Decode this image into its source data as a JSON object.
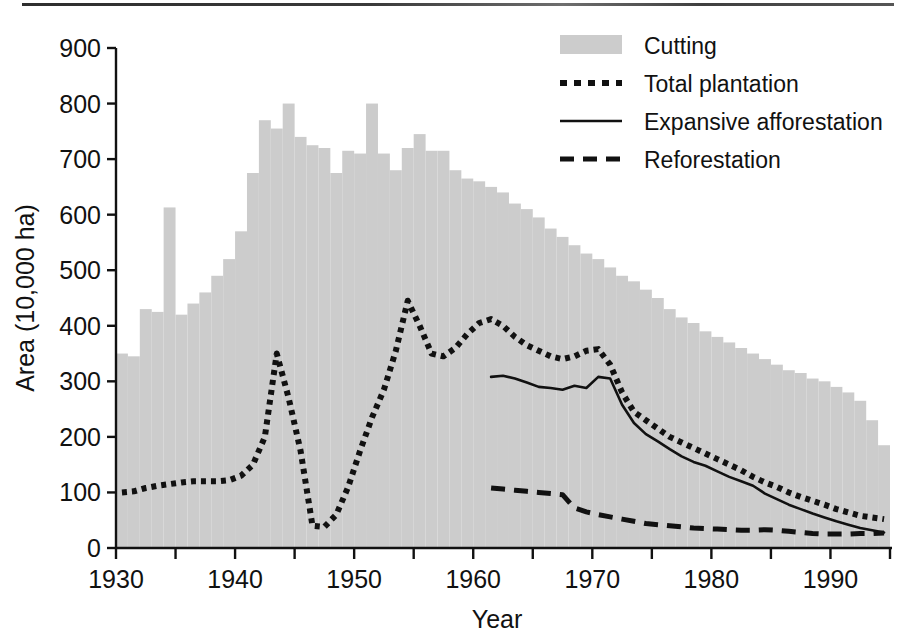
{
  "chart_data": {
    "type": "bar",
    "title": "",
    "xlabel": "Year",
    "ylabel": "Area (10,000 ha)",
    "xlim": [
      1930,
      1995
    ],
    "ylim": [
      0,
      900
    ],
    "grid": false,
    "legend_position": "top-right",
    "xticks": [
      1930,
      1940,
      1950,
      1960,
      1970,
      1980,
      1990
    ],
    "xtick_labels": [
      "1930",
      "1940",
      "1950",
      "1960",
      "1970",
      "1980",
      "1990"
    ],
    "xminor_tick_interval": 5,
    "yticks": [
      0,
      100,
      200,
      300,
      400,
      500,
      600,
      700,
      800,
      900
    ],
    "ytick_labels": [
      "0",
      "100",
      "200",
      "300",
      "400",
      "500",
      "600",
      "700",
      "800",
      "900"
    ],
    "legend": [
      {
        "label": "Cutting",
        "marker": "filled-rect",
        "color": "#cccccc"
      },
      {
        "label": "Total plantation",
        "marker": "dotted-line",
        "color": "#111111"
      },
      {
        "label": "Expansive afforestation",
        "marker": "solid-line",
        "color": "#111111"
      },
      {
        "label": "Reforestation",
        "marker": "dashed-line",
        "color": "#111111"
      }
    ],
    "series": [
      {
        "name": "Cutting",
        "type": "bar",
        "color": "#cccccc",
        "x": [
          1930,
          1931,
          1932,
          1933,
          1934,
          1935,
          1936,
          1937,
          1938,
          1939,
          1940,
          1941,
          1942,
          1943,
          1944,
          1945,
          1946,
          1947,
          1948,
          1949,
          1950,
          1951,
          1952,
          1953,
          1954,
          1955,
          1956,
          1957,
          1958,
          1959,
          1960,
          1961,
          1962,
          1963,
          1964,
          1965,
          1966,
          1967,
          1968,
          1969,
          1970,
          1971,
          1972,
          1973,
          1974,
          1975,
          1976,
          1977,
          1978,
          1979,
          1980,
          1981,
          1982,
          1983,
          1984,
          1985,
          1986,
          1987,
          1988,
          1989,
          1990,
          1991,
          1992,
          1993,
          1994
        ],
        "values": [
          350,
          345,
          430,
          425,
          613,
          420,
          440,
          460,
          490,
          520,
          570,
          675,
          770,
          755,
          800,
          740,
          725,
          720,
          675,
          715,
          710,
          800,
          710,
          680,
          720,
          745,
          715,
          715,
          680,
          665,
          660,
          650,
          640,
          620,
          610,
          595,
          575,
          560,
          545,
          530,
          520,
          505,
          490,
          480,
          465,
          450,
          430,
          415,
          405,
          390,
          380,
          370,
          360,
          350,
          340,
          330,
          320,
          315,
          305,
          300,
          290,
          280,
          265,
          230,
          185
        ]
      },
      {
        "name": "Total plantation",
        "type": "line",
        "style": "dotted",
        "color": "#111111",
        "x": [
          1930,
          1931,
          1932,
          1933,
          1934,
          1935,
          1936,
          1937,
          1938,
          1939,
          1940,
          1941,
          1942,
          1943,
          1944,
          1945,
          1946,
          1947,
          1948,
          1949,
          1950,
          1951,
          1952,
          1953,
          1954,
          1955,
          1956,
          1957,
          1958,
          1959,
          1960,
          1961,
          1962,
          1963,
          1964,
          1965,
          1966,
          1967,
          1968,
          1969,
          1970,
          1971,
          1972,
          1973,
          1974,
          1975,
          1976,
          1977,
          1978,
          1979,
          1980,
          1981,
          1982,
          1983,
          1984,
          1985,
          1986,
          1987,
          1988,
          1989,
          1990,
          1991,
          1992,
          1993,
          1994
        ],
        "values": [
          100,
          102,
          108,
          112,
          115,
          118,
          120,
          120,
          120,
          122,
          130,
          150,
          200,
          350,
          270,
          175,
          40,
          38,
          60,
          110,
          175,
          235,
          285,
          355,
          445,
          400,
          350,
          345,
          360,
          385,
          405,
          412,
          400,
          380,
          365,
          355,
          345,
          340,
          345,
          355,
          358,
          330,
          280,
          245,
          230,
          215,
          200,
          190,
          180,
          170,
          160,
          150,
          140,
          128,
          118,
          110,
          100,
          92,
          85,
          78,
          70,
          64,
          58,
          55,
          52
        ]
      },
      {
        "name": "Expansive afforestation",
        "type": "line",
        "style": "solid",
        "color": "#111111",
        "x": [
          1961,
          1962,
          1963,
          1964,
          1965,
          1966,
          1967,
          1968,
          1969,
          1970,
          1971,
          1972,
          1973,
          1974,
          1975,
          1976,
          1977,
          1978,
          1979,
          1980,
          1981,
          1982,
          1983,
          1984,
          1985,
          1986,
          1987,
          1988,
          1989,
          1990,
          1991,
          1992,
          1993,
          1994
        ],
        "values": [
          308,
          310,
          305,
          298,
          290,
          288,
          285,
          292,
          288,
          308,
          305,
          258,
          225,
          205,
          192,
          178,
          165,
          155,
          148,
          138,
          128,
          120,
          112,
          98,
          88,
          78,
          70,
          62,
          55,
          48,
          42,
          36,
          32,
          28
        ]
      },
      {
        "name": "Reforestation",
        "type": "line",
        "style": "dashed",
        "color": "#111111",
        "x": [
          1961,
          1962,
          1963,
          1964,
          1965,
          1966,
          1967,
          1968,
          1969,
          1970,
          1971,
          1972,
          1973,
          1974,
          1975,
          1976,
          1977,
          1978,
          1979,
          1980,
          1981,
          1982,
          1983,
          1984,
          1985,
          1986,
          1987,
          1988,
          1989,
          1990,
          1991,
          1992,
          1993,
          1994
        ],
        "values": [
          108,
          106,
          104,
          102,
          100,
          98,
          96,
          72,
          65,
          60,
          56,
          52,
          48,
          44,
          42,
          40,
          38,
          36,
          35,
          34,
          33,
          32,
          32,
          33,
          32,
          30,
          28,
          26,
          25,
          25,
          25,
          26,
          26,
          27
        ]
      }
    ]
  }
}
